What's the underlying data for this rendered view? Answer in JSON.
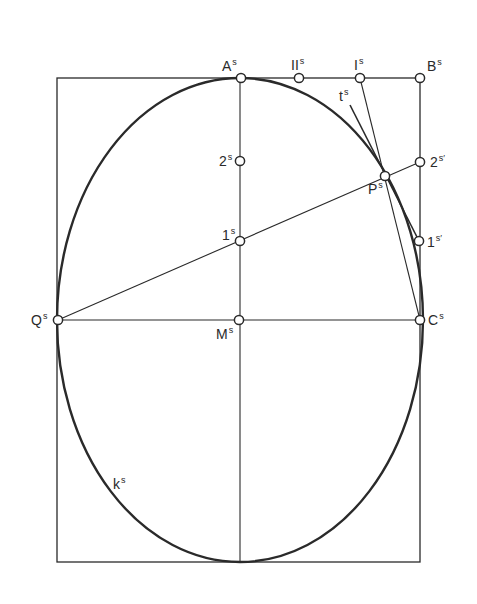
{
  "diagram": {
    "type": "geometric-construction",
    "colors": {
      "ink": "#2a2a2a",
      "background": "#ffffff"
    },
    "rectangle": {
      "x1": 57,
      "y1": 78,
      "x2": 420,
      "y2": 562
    },
    "ellipse": {
      "cx": 240,
      "cy": 320,
      "rx": 183,
      "ry": 242,
      "label": "k",
      "label_sup": "s"
    },
    "points": [
      {
        "id": "A",
        "x": 241,
        "y": 78,
        "label": "A",
        "sup": "s",
        "lx": 222,
        "ly": 71
      },
      {
        "id": "II",
        "x": 299,
        "y": 78,
        "label": "II",
        "sup": "s",
        "lx": 291,
        "ly": 70
      },
      {
        "id": "I",
        "x": 360,
        "y": 78,
        "label": "I",
        "sup": "s",
        "lx": 354,
        "ly": 70
      },
      {
        "id": "B",
        "x": 420,
        "y": 78,
        "label": "B",
        "sup": "s",
        "lx": 427,
        "ly": 71
      },
      {
        "id": "2s",
        "x": 240,
        "y": 161,
        "label": "2",
        "sup": "s",
        "lx": 219,
        "ly": 166
      },
      {
        "id": "2sp",
        "x": 420,
        "y": 162,
        "label": "2",
        "sup": "s′",
        "lx": 430,
        "ly": 167
      },
      {
        "id": "P",
        "x": 385,
        "y": 176,
        "label": "P",
        "sup": "s",
        "lx": 368,
        "ly": 194
      },
      {
        "id": "1s",
        "x": 240,
        "y": 241,
        "label": "1",
        "sup": "s",
        "lx": 222,
        "ly": 240
      },
      {
        "id": "1sp",
        "x": 419,
        "y": 241,
        "label": "1",
        "sup": "s′",
        "lx": 427,
        "ly": 247
      },
      {
        "id": "Q",
        "x": 58,
        "y": 320,
        "label": "Q",
        "sup": "s",
        "lx": 31,
        "ly": 325
      },
      {
        "id": "M",
        "x": 239,
        "y": 320,
        "label": "M",
        "sup": "s",
        "lx": 216,
        "ly": 339
      },
      {
        "id": "C",
        "x": 420,
        "y": 320,
        "label": "C",
        "sup": "s",
        "lx": 428,
        "ly": 325
      }
    ],
    "lines": [
      {
        "name": "vertical-axis",
        "x1": 240,
        "y1": 78,
        "x2": 240,
        "y2": 562
      },
      {
        "name": "horizontal-axis",
        "x1": 57,
        "y1": 320,
        "x2": 420,
        "y2": 320
      },
      {
        "name": "ray-Q-through-1s",
        "x1": 58,
        "y1": 320,
        "x2": 420,
        "y2": 162
      },
      {
        "name": "line-I-to-C",
        "x1": 360,
        "y1": 78,
        "x2": 420,
        "y2": 320
      },
      {
        "name": "tangent-t",
        "x1": 350,
        "y1": 105,
        "x2": 419,
        "y2": 241
      }
    ],
    "tangent_label": {
      "label": "t",
      "sup": "s",
      "x": 339,
      "y": 101
    },
    "curve_label_pos": {
      "x": 113,
      "y": 489
    }
  }
}
